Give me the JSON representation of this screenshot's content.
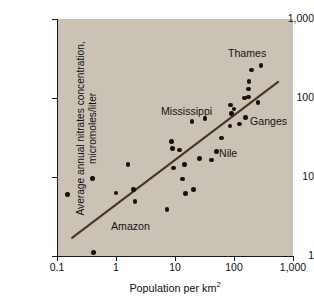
{
  "figure": {
    "background": "#ffffff",
    "plot_background": "#cbc2b6",
    "dot_color": "#17120e",
    "trend_color": "#4a3526"
  },
  "axes": {
    "x_label_text": "Population per km",
    "x_label_sup": "2",
    "y_label_line1": "Average annual nitrates concentration,",
    "y_label_line2": "micromoles/liter",
    "x_ticks": [
      "0.1",
      "1",
      "10",
      "100",
      "1,000"
    ],
    "y_ticks": [
      "1,000",
      "100",
      "10",
      "1"
    ]
  },
  "chart_data": {
    "type": "scatter",
    "title": "",
    "xlabel": "Population per km²",
    "ylabel": "Average annual nitrates concentration, micromoles/liter",
    "xscale": "log",
    "yscale": "log",
    "xlim": [
      0.1,
      1000
    ],
    "ylim": [
      1,
      1000
    ],
    "grid": false,
    "legend": null,
    "points": [
      {
        "x": 0.15,
        "y": 6.0
      },
      {
        "x": 0.4,
        "y": 9.6
      },
      {
        "x": 0.42,
        "y": 1.1
      },
      {
        "x": 1.0,
        "y": 6.3
      },
      {
        "x": 1.6,
        "y": 14.5
      },
      {
        "x": 2.0,
        "y": 7.0
      },
      {
        "x": 2.1,
        "y": 4.9
      },
      {
        "x": 7.3,
        "y": 3.9
      },
      {
        "x": 8.8,
        "y": 28.0
      },
      {
        "x": 9.0,
        "y": 23.0
      },
      {
        "x": 9.4,
        "y": 13.0
      },
      {
        "x": 12.0,
        "y": 22.0
      },
      {
        "x": 13.5,
        "y": 9.4
      },
      {
        "x": 14.5,
        "y": 14.3
      },
      {
        "x": 15.0,
        "y": 6.2
      },
      {
        "x": 19.5,
        "y": 50.0
      },
      {
        "x": 20.5,
        "y": 7.0
      },
      {
        "x": 26.0,
        "y": 17.0
      },
      {
        "x": 32.0,
        "y": 55.0
      },
      {
        "x": 42.0,
        "y": 16.5
      },
      {
        "x": 50.0,
        "y": 21.0
      },
      {
        "x": 62.0,
        "y": 31.0
      },
      {
        "x": 85.0,
        "y": 44.0
      },
      {
        "x": 88.0,
        "y": 82.0
      },
      {
        "x": 90.0,
        "y": 64.0
      },
      {
        "x": 100.0,
        "y": 73.0
      },
      {
        "x": 125.0,
        "y": 47.0
      },
      {
        "x": 150.0,
        "y": 100.0
      },
      {
        "x": 155.0,
        "y": 57.0
      },
      {
        "x": 175.0,
        "y": 103.0
      },
      {
        "x": 178.0,
        "y": 130.0
      },
      {
        "x": 180.0,
        "y": 163.0
      },
      {
        "x": 200.0,
        "y": 225.0
      },
      {
        "x": 255.0,
        "y": 88.0
      },
      {
        "x": 285.0,
        "y": 260.0
      }
    ],
    "trendline": {
      "x_start": 0.18,
      "y_start": 1.7,
      "x_end": 560,
      "y_end": 160
    },
    "annotations": [
      {
        "text": "Thames",
        "x_px": 228,
        "y_px": 48
      },
      {
        "text": "Mississippi",
        "x_px": 161,
        "y_px": 106
      },
      {
        "text": "Ganges",
        "x_px": 250,
        "y_px": 116
      },
      {
        "text": "Nile",
        "x_px": 219,
        "y_px": 148
      },
      {
        "text": "Amazon",
        "x_px": 111,
        "y_px": 221
      }
    ]
  }
}
